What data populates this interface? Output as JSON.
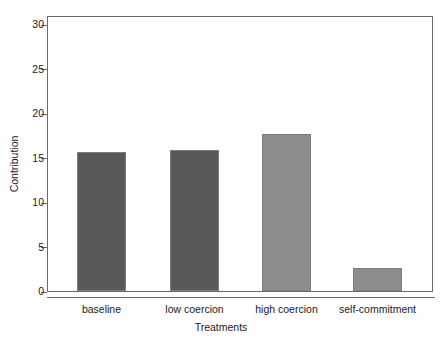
{
  "chart_data": {
    "type": "bar",
    "title": "",
    "xlabel": "Treatments",
    "ylabel": "Contribution",
    "categories": [
      "baseline",
      "low coercion",
      "high coercion",
      "self-commitment"
    ],
    "values": [
      15.6,
      15.8,
      17.7,
      2.6
    ],
    "ylim": [
      0,
      30
    ],
    "yticks": [
      0,
      5,
      10,
      15,
      20,
      25,
      30
    ],
    "ytick_labels": [
      "0",
      "5",
      "10",
      "15",
      "20",
      "25",
      "30"
    ],
    "grid": false,
    "legend": null,
    "bar_colors": [
      "#585858",
      "#585858",
      "#8d8d8d",
      "#8d8d8d"
    ],
    "bar_border_color": "#7d7d7d",
    "axis_color": "#6b6b6b",
    "background": "#ffffff"
  }
}
